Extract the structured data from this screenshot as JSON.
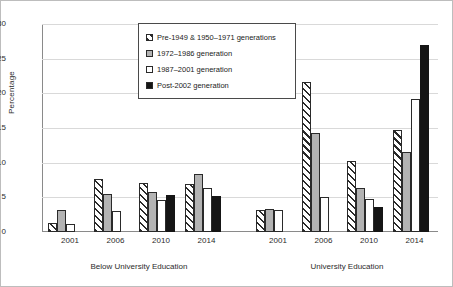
{
  "chart_data": {
    "type": "bar",
    "title": "",
    "xlabel": "",
    "ylabel": "Percentage",
    "ylim": [
      0,
      30
    ],
    "yticks": [
      0,
      5,
      10,
      15,
      20,
      25,
      30
    ],
    "grid": true,
    "legend_position": "top-center",
    "group_labels": [
      "Below University Education",
      "University Education"
    ],
    "categories": [
      "2001",
      "2006",
      "2010",
      "2014",
      "2001",
      "2006",
      "2010",
      "2014"
    ],
    "series": [
      {
        "name": "Pre-1949 & 1950–1971 generations",
        "style": "hatched-diagonal",
        "color": "#ffffff",
        "values": [
          1.3,
          7.6,
          7.1,
          6.9,
          3.2,
          21.7,
          10.3,
          14.7
        ]
      },
      {
        "name": "1972–1986 generation",
        "style": "solid-gray",
        "color": "#b3b3b3",
        "values": [
          3.2,
          5.5,
          5.7,
          8.4,
          3.3,
          14.3,
          6.3,
          11.6
        ]
      },
      {
        "name": "1987–2001 generation",
        "style": "open-white",
        "color": "#ffffff",
        "values": [
          1.1,
          3.0,
          4.6,
          6.3,
          3.2,
          5.1,
          4.7,
          19.2
        ]
      },
      {
        "name": "Post-2002 generation",
        "style": "solid-black",
        "color": "#151515",
        "values": [
          null,
          null,
          5.3,
          5.2,
          null,
          null,
          3.6,
          27.0
        ]
      }
    ]
  },
  "legend": {
    "items": [
      {
        "label": "Pre-1949 & 1950–1971 generations"
      },
      {
        "label": "1972–1986 generation"
      },
      {
        "label": "1987–2001 generation"
      },
      {
        "label": "Post-2002 generation"
      }
    ]
  },
  "axis": {
    "y_title": "Percentage",
    "y_ticks": [
      "30",
      "25",
      "20",
      "15",
      "10",
      "5",
      "0"
    ]
  },
  "groups": [
    {
      "label": "Below University Education",
      "categories": [
        "2001",
        "2006",
        "2010",
        "2014"
      ]
    },
    {
      "label": "University Education",
      "categories": [
        "2001",
        "2006",
        "2010",
        "2014"
      ]
    }
  ]
}
